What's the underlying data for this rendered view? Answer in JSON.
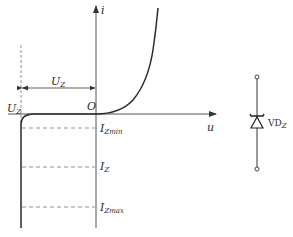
{
  "figure": {
    "type": "zener-diode-iv-characteristic",
    "axes": {
      "x_label": "u",
      "y_label": "i",
      "origin_label": "O"
    },
    "annotations": {
      "uz_dimension": {
        "main": "U",
        "sub": "Z"
      },
      "uz_axis_label": {
        "main": "U",
        "sub": "Z"
      },
      "current_levels": [
        {
          "main": "I",
          "sub": "Zmin"
        },
        {
          "main": "I",
          "sub": "Z"
        },
        {
          "main": "I",
          "sub": "Zmax"
        }
      ]
    },
    "symbol": {
      "name": "zener-diode",
      "label_main": "VD",
      "label_sub": "Z"
    },
    "colors": {
      "line": "#2a2a2a",
      "axis": "#555555",
      "dashed": "#777777",
      "background": "#ffffff"
    }
  }
}
